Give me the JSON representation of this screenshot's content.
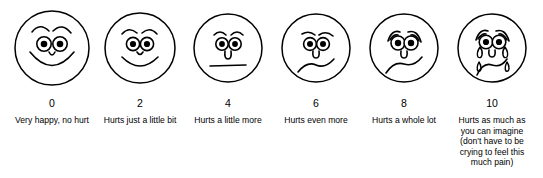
{
  "scale": {
    "faces": [
      {
        "number": "0",
        "caption": "Very happy, no hurt",
        "expression": "very-happy",
        "icon": "face-very-happy-icon"
      },
      {
        "number": "2",
        "caption": "Hurts just a little bit",
        "expression": "happy",
        "icon": "face-happy-icon"
      },
      {
        "number": "4",
        "caption": "Hurts a little more",
        "expression": "neutral",
        "icon": "face-neutral-icon"
      },
      {
        "number": "6",
        "caption": "Hurts even more",
        "expression": "frowning",
        "icon": "face-frowning-icon"
      },
      {
        "number": "8",
        "caption": "Hurts a whole lot",
        "expression": "very-sad",
        "icon": "face-very-sad-icon"
      },
      {
        "number": "10",
        "caption": "Hurts as much as\nyou can imagine\n(don't have to be\ncrying to feel this\nmuch pain)",
        "expression": "crying",
        "icon": "face-crying-icon"
      }
    ]
  },
  "colors": {
    "stroke": "#000000",
    "background": "#ffffff",
    "text": "#000000"
  }
}
